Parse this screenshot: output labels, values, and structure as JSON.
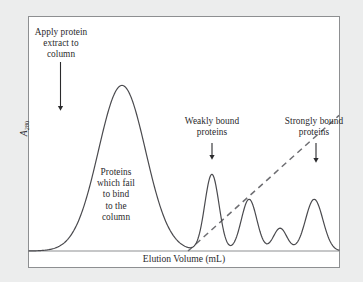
{
  "figure": {
    "background_color": "#eceded",
    "panel_color": "#ffffff",
    "frame_color": "#8d8f91",
    "trace_color": "#4a4a4e",
    "gradient_color": "#6e6e72",
    "text_color": "#2a2a2c"
  },
  "axes": {
    "x_label": "Elution Volume (mL)",
    "y_label_symbol": "A",
    "y_label_subscript": "280"
  },
  "annotations": {
    "apply": "Apply protein\nextract to\ncolumn",
    "unbound": "Proteins\nwhich fail\nto bind\nto the\ncolumn",
    "weakly_bound": "Weakly bound\nproteins",
    "strongly_bound": "Strongly bound\nproteins"
  },
  "chart_data": {
    "type": "line",
    "title": "",
    "xlabel": "Elution Volume (mL)",
    "ylabel": "A280",
    "xlim": [
      0,
      100
    ],
    "ylim": [
      0,
      100
    ],
    "grid": false,
    "legend": "none",
    "series": [
      {
        "name": "Absorbance trace",
        "style": "solid",
        "color": "#4a4a4e",
        "peaks": [
          {
            "label": "Proteins which fail to bind to the column",
            "center": 30.0,
            "height": 80.0,
            "width": 7.6
          },
          {
            "label": "Weakly bound proteins peak 1",
            "center": 59.0,
            "height": 37.0,
            "width": 2.3
          },
          {
            "label": "Weakly bound proteins peak 2",
            "center": 71.0,
            "height": 25.0,
            "width": 2.5
          },
          {
            "label": "Intermediate peak",
            "center": 81.0,
            "height": 11.0,
            "width": 2.2
          },
          {
            "label": "Strongly bound proteins peak",
            "center": 92.0,
            "height": 25.0,
            "width": 2.8
          }
        ]
      },
      {
        "name": "Salt gradient",
        "style": "dashed",
        "color": "#6e6e72",
        "x": [
          51.3,
          100.0
        ],
        "y": [
          0.0,
          65.5
        ]
      }
    ],
    "markers": [
      {
        "name": "apply-sample-arrow",
        "x": 10.3,
        "y_from": 78.5,
        "y_to": 56.0,
        "direction": "down"
      },
      {
        "name": "weakly-bound-arrow",
        "x": 59.0,
        "y_from": 49.5,
        "y_to": 38.8,
        "direction": "down"
      },
      {
        "name": "strongly-bound-arrow",
        "x": 92.0,
        "y_from": 49.5,
        "y_to": 38.0,
        "direction": "down"
      }
    ]
  }
}
